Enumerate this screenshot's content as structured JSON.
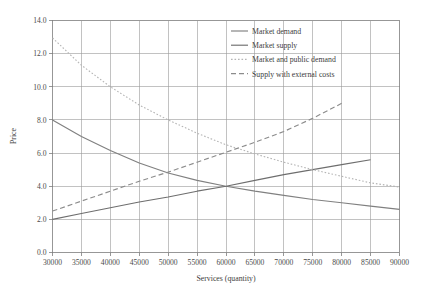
{
  "chart_data": {
    "type": "line",
    "title": "",
    "xlabel": "Services (quantity)",
    "ylabel": "Price",
    "xlim": [
      30000,
      90000
    ],
    "ylim": [
      0.0,
      14.0
    ],
    "xticks": [
      30000,
      35000,
      40000,
      45000,
      50000,
      55000,
      60000,
      65000,
      70000,
      75000,
      80000,
      85000,
      90000
    ],
    "xtick_labels": [
      "30000",
      "35000",
      "40000",
      "45000",
      "50000",
      "55000",
      "60000",
      "65000",
      "70000",
      "75000",
      "80000",
      "85000",
      "90000"
    ],
    "yticks": [
      0.0,
      2.0,
      4.0,
      6.0,
      8.0,
      10.0,
      12.0,
      14.0
    ],
    "ytick_labels": [
      "0.0",
      "2.0",
      "4.0",
      "6.0",
      "8.0",
      "10.0",
      "12.0",
      "14.0"
    ],
    "grid": true,
    "legend_position": "top-right",
    "series": [
      {
        "name": "Market demand",
        "style": "solid",
        "color": "#808080",
        "x": [
          30000,
          35000,
          40000,
          45000,
          50000,
          55000,
          60000,
          65000,
          70000,
          75000,
          80000,
          85000,
          90000
        ],
        "y": [
          8.0,
          7.0,
          6.15,
          5.4,
          4.8,
          4.35,
          4.0,
          3.7,
          3.45,
          3.2,
          3.0,
          2.8,
          2.6
        ]
      },
      {
        "name": "Market supply",
        "style": "solid",
        "color": "#6e6e6e",
        "x": [
          30000,
          35000,
          40000,
          45000,
          50000,
          55000,
          60000,
          65000,
          70000,
          75000,
          80000,
          85000
        ],
        "y": [
          2.0,
          2.35,
          2.7,
          3.05,
          3.35,
          3.7,
          4.0,
          4.35,
          4.7,
          5.0,
          5.3,
          5.6
        ]
      },
      {
        "name": "Market and public demand",
        "style": "dotted",
        "color": "#b5b5b5",
        "x": [
          30000,
          35000,
          40000,
          45000,
          50000,
          55000,
          60000,
          65000,
          70000,
          75000,
          80000,
          85000,
          90000
        ],
        "y": [
          12.95,
          11.3,
          10.0,
          8.9,
          8.0,
          7.2,
          6.5,
          5.95,
          5.45,
          5.0,
          4.6,
          4.2,
          3.95
        ]
      },
      {
        "name": "Supply with external costs",
        "style": "dashed",
        "color": "#8c8c8c",
        "x": [
          30000,
          35000,
          40000,
          45000,
          50000,
          55000,
          60000,
          65000,
          70000,
          75000,
          80000
        ],
        "y": [
          2.5,
          3.1,
          3.7,
          4.3,
          4.85,
          5.45,
          6.05,
          6.65,
          7.3,
          8.1,
          9.0
        ]
      }
    ],
    "legend_entries": [
      {
        "label": "Market demand",
        "style": "solid",
        "color": "#808080"
      },
      {
        "label": "Market supply",
        "style": "solid",
        "color": "#6e6e6e"
      },
      {
        "label": "Market and public demand",
        "style": "dotted",
        "color": "#b5b5b5"
      },
      {
        "label": "Supply with external costs",
        "style": "dashed",
        "color": "#8c8c8c"
      }
    ]
  }
}
